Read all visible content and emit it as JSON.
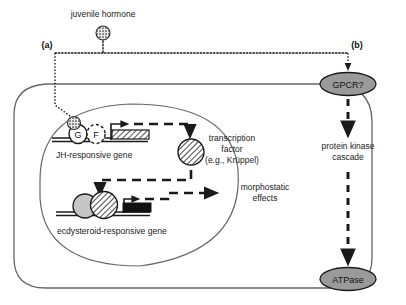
{
  "figure": {
    "type": "biological-signaling-pathway"
  },
  "labels": {
    "hormone": "juvenile hormone",
    "branch_a": "(a)",
    "branch_b": "(b)",
    "jh_gene": "JH-responsive gene",
    "ecdysteroid_gene": "ecdysteroid-responsive gene",
    "transcription_factor_line1": "transcription",
    "transcription_factor_line2": "factor",
    "transcription_factor_line3": "(e.g., Krüppel)",
    "morphostatic_line1": "morphostatic",
    "morphostatic_line2": "effects",
    "protein_kinase_line1": "protein kinase",
    "protein_kinase_line2": "cascade",
    "gpcr": "GPCR?",
    "atpase": "ATPase",
    "promoter_g": "G",
    "promoter_f": "F"
  },
  "icons": {
    "hormone_molecule": "stippled-circle-icon",
    "jh_receptor": "stippled-circle-icon",
    "transcription_factor": "hatched-circle-icon",
    "ecdysteroid_receptor_grey": "grey-circle-icon",
    "ecdysteroid_receptor_hatched": "hatched-circle-icon",
    "gpcr_node": "grey-ellipse-icon",
    "atpase_node": "grey-ellipse-icon",
    "jh_gene_box": "hatched-box-icon",
    "ecdysteroid_gene_box": "solid-box-icon",
    "transcription_start_arrow": "bent-arrow-icon",
    "dotted_connector": "dotted-line-icon",
    "dashed_connector": "dashed-arrow-icon"
  },
  "colors": {
    "line": "#1a1a1a",
    "membrane": "#555555",
    "node_fill": "#9a9a9a",
    "grey_fill": "#bdbdbd",
    "background": "#ffffff"
  }
}
